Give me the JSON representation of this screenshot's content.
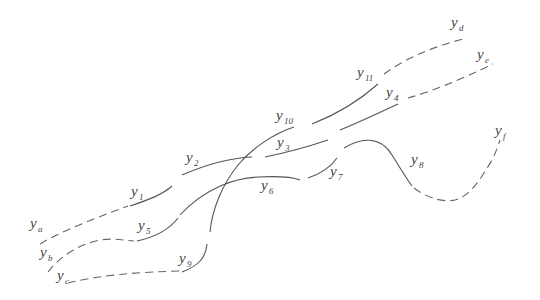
{
  "diagram": {
    "type": "trajectory-braid",
    "labels": {
      "ya": {
        "base": "y",
        "sub": "a"
      },
      "yb": {
        "base": "y",
        "sub": "b"
      },
      "yc": {
        "base": "y",
        "sub": "c"
      },
      "yd": {
        "base": "y",
        "sub": "d"
      },
      "ye": {
        "base": "y",
        "sub": "e"
      },
      "yf": {
        "base": "y",
        "sub": "f"
      },
      "y1": {
        "base": "y",
        "sub": "1"
      },
      "y2": {
        "base": "y",
        "sub": "2"
      },
      "y3": {
        "base": "y",
        "sub": "3"
      },
      "y4": {
        "base": "y",
        "sub": "4"
      },
      "y5": {
        "base": "y",
        "sub": "5"
      },
      "y6": {
        "base": "y",
        "sub": "6"
      },
      "y7": {
        "base": "y",
        "sub": "7"
      },
      "y8": {
        "base": "y",
        "sub": "8"
      },
      "y9": {
        "base": "y",
        "sub": "9"
      },
      "y10": {
        "base": "y",
        "sub": "10"
      },
      "y11": {
        "base": "y",
        "sub": "11"
      }
    },
    "colors": {
      "line": "#555555",
      "dashed": "#666666",
      "text": "#444444",
      "background": "#ffffff"
    }
  }
}
